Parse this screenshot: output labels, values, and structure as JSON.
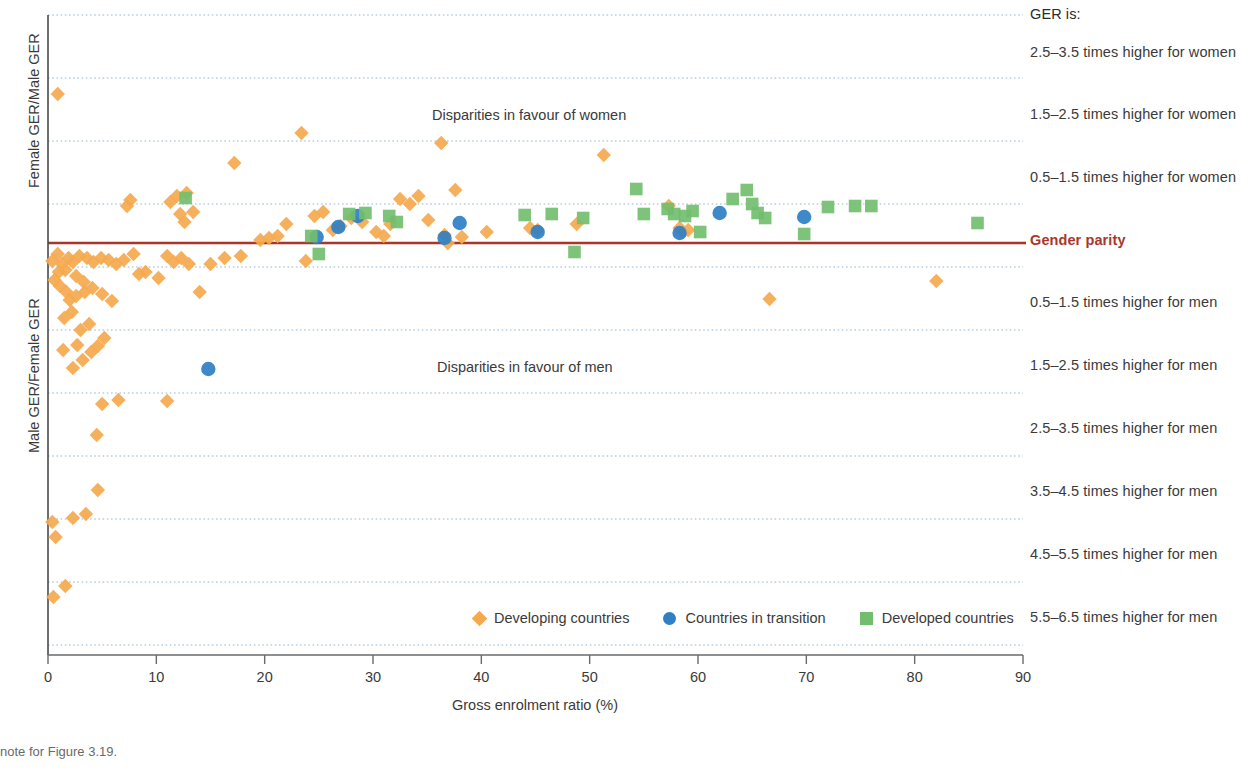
{
  "chart_data": {
    "type": "scatter",
    "title": "",
    "xlabel": "Gross enrolment ratio (%)",
    "ylabel_top": "Female GER/Male GER",
    "ylabel_bottom": "Male GER/Female GER",
    "xlim": [
      0,
      90
    ],
    "xticks": [
      0,
      10,
      20,
      30,
      40,
      50,
      60,
      70,
      80,
      90
    ],
    "ylim_bands": [
      "2.5-3.5 times higher for women",
      "1.5-2.5 times higher for women",
      "0.5-1.5 times higher for women",
      "Gender parity",
      "0.5-1.5 times higher for men",
      "1.5-2.5 times higher for men",
      "2.5-3.5 times higher for men",
      "3.5-4.5 times higher for men",
      "4.5-5.5 times higher for men",
      "5.5-6.5 times higher for men"
    ],
    "grid": true,
    "legend_position": "bottom-center",
    "parity_line_color": "#a8372b",
    "gridline_color": "#8fb8d8",
    "annotations": [
      {
        "text": "Disparities in favour of women",
        "x": 36.5,
        "y_px": 116
      },
      {
        "text": "Disparities in favour of men",
        "x": 36.5,
        "y_px": 368
      }
    ],
    "series": [
      {
        "name": "Developing countries",
        "marker": "diamond",
        "color": "#f5a94e",
        "points": [
          [
            0.9,
            94
          ],
          [
            0.4,
            261
          ],
          [
            0.9,
            254
          ],
          [
            1.3,
            264
          ],
          [
            1.9,
            258
          ],
          [
            1.0,
            272
          ],
          [
            1.6,
            270
          ],
          [
            2.3,
            262
          ],
          [
            2.9,
            256
          ],
          [
            3.6,
            258
          ],
          [
            4.2,
            262
          ],
          [
            4.9,
            258
          ],
          [
            5.6,
            260
          ],
          [
            6.3,
            264
          ],
          [
            2.6,
            276
          ],
          [
            3.3,
            282
          ],
          [
            1.1,
            286
          ],
          [
            1.7,
            292
          ],
          [
            0.6,
            280
          ],
          [
            2.0,
            300
          ],
          [
            2.6,
            296
          ],
          [
            3.4,
            292
          ],
          [
            4.1,
            288
          ],
          [
            5.0,
            294
          ],
          [
            5.9,
            301
          ],
          [
            7.0,
            260
          ],
          [
            7.6,
            200
          ],
          [
            7.3,
            206
          ],
          [
            7.9,
            254
          ],
          [
            8.4,
            274
          ],
          [
            9.0,
            272
          ],
          [
            10.2,
            278
          ],
          [
            11.3,
            202
          ],
          [
            11.9,
            196
          ],
          [
            12.2,
            214
          ],
          [
            12.6,
            222
          ],
          [
            12.8,
            193
          ],
          [
            13.4,
            212
          ],
          [
            11.0,
            256
          ],
          [
            11.6,
            262
          ],
          [
            12.3,
            258
          ],
          [
            13.0,
            264
          ],
          [
            14.0,
            292
          ],
          [
            15.0,
            264
          ],
          [
            16.3,
            258
          ],
          [
            17.2,
            163
          ],
          [
            17.8,
            256
          ],
          [
            19.6,
            240
          ],
          [
            20.4,
            238
          ],
          [
            21.2,
            236
          ],
          [
            22.0,
            224
          ],
          [
            23.4,
            133
          ],
          [
            23.8,
            261
          ],
          [
            24.6,
            216
          ],
          [
            25.4,
            212
          ],
          [
            26.3,
            230
          ],
          [
            27.0,
            226
          ],
          [
            28.0,
            218
          ],
          [
            29.0,
            222
          ],
          [
            30.3,
            232
          ],
          [
            31.0,
            236
          ],
          [
            31.6,
            224
          ],
          [
            32.5,
            199
          ],
          [
            33.4,
            204
          ],
          [
            34.2,
            196
          ],
          [
            35.1,
            220
          ],
          [
            36.3,
            143
          ],
          [
            36.6,
            235
          ],
          [
            36.9,
            243
          ],
          [
            37.6,
            190
          ],
          [
            38.2,
            237
          ],
          [
            40.5,
            232
          ],
          [
            44.5,
            228
          ],
          [
            45.2,
            230
          ],
          [
            48.8,
            224
          ],
          [
            51.3,
            155
          ],
          [
            57.3,
            206
          ],
          [
            58.3,
            228
          ],
          [
            58.6,
            232
          ],
          [
            59.1,
            230
          ],
          [
            66.6,
            299
          ],
          [
            82.0,
            281
          ],
          [
            1.5,
            318
          ],
          [
            2.2,
            312
          ],
          [
            3.0,
            330
          ],
          [
            3.8,
            324
          ],
          [
            2.7,
            345
          ],
          [
            4.0,
            352
          ],
          [
            4.6,
            346
          ],
          [
            5.2,
            338
          ],
          [
            3.2,
            360
          ],
          [
            2.3,
            368
          ],
          [
            1.4,
            350
          ],
          [
            5.0,
            404
          ],
          [
            6.5,
            400
          ],
          [
            11.0,
            401
          ],
          [
            4.5,
            435
          ],
          [
            4.6,
            490
          ],
          [
            2.3,
            518
          ],
          [
            3.5,
            514
          ],
          [
            0.4,
            522
          ],
          [
            0.7,
            537
          ],
          [
            1.6,
            586
          ],
          [
            0.5,
            597
          ]
        ]
      },
      {
        "name": "Countries in transition",
        "marker": "circle",
        "color": "#2e7fc4",
        "points": [
          [
            14.8,
            369
          ],
          [
            24.8,
            237
          ],
          [
            26.8,
            227
          ],
          [
            28.6,
            216
          ],
          [
            36.6,
            238
          ],
          [
            38.0,
            223
          ],
          [
            45.2,
            232
          ],
          [
            58.3,
            233
          ],
          [
            62.0,
            213
          ],
          [
            69.8,
            217
          ]
        ]
      },
      {
        "name": "Developed countries",
        "marker": "square",
        "color": "#72be6e",
        "points": [
          [
            12.7,
            198
          ],
          [
            24.3,
            236
          ],
          [
            25.0,
            254
          ],
          [
            27.8,
            214
          ],
          [
            29.3,
            213
          ],
          [
            31.5,
            216
          ],
          [
            32.2,
            222
          ],
          [
            44.0,
            215
          ],
          [
            46.5,
            214
          ],
          [
            48.6,
            252
          ],
          [
            49.4,
            218
          ],
          [
            54.3,
            189
          ],
          [
            55.0,
            214
          ],
          [
            57.2,
            209
          ],
          [
            57.8,
            214
          ],
          [
            58.8,
            216
          ],
          [
            59.5,
            211
          ],
          [
            60.2,
            232
          ],
          [
            63.2,
            199
          ],
          [
            64.5,
            190
          ],
          [
            65.0,
            204
          ],
          [
            65.5,
            213
          ],
          [
            66.2,
            218
          ],
          [
            69.8,
            234
          ],
          [
            72.0,
            207
          ],
          [
            74.5,
            206
          ],
          [
            76.0,
            206
          ],
          [
            85.8,
            223
          ]
        ]
      }
    ]
  },
  "right_labels": {
    "heading": "GER is:",
    "items": [
      "2.5–3.5 times higher for women",
      "1.5–2.5 times higher for women",
      "0.5–1.5 times higher for women",
      "Gender parity",
      "0.5–1.5 times higher for men",
      "1.5–2.5 times higher for men",
      "2.5–3.5 times higher for men",
      "3.5–4.5 times higher for men",
      "4.5–5.5 times higher for men",
      "5.5–6.5 times higher for men"
    ]
  },
  "legend": {
    "entries": [
      {
        "label": "Developing countries",
        "marker": "diamond-marker-icon",
        "color": "#f5a94e"
      },
      {
        "label": "Countries in transition",
        "marker": "circle-marker-icon",
        "color": "#2e7fc4"
      },
      {
        "label": "Developed countries",
        "marker": "square-marker-icon",
        "color": "#72be6e"
      }
    ]
  },
  "footnote": {
    "line1": "note for Figure 3.19.",
    "line2": ""
  }
}
